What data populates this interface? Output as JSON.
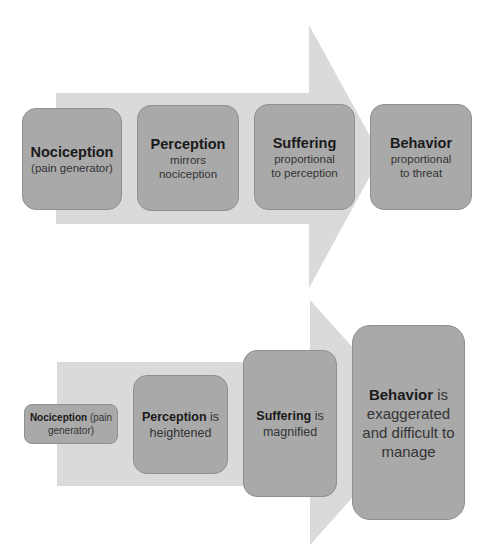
{
  "colors": {
    "arrow_fill": "#dadada",
    "box_fill": "#a9a9a9",
    "box_border": "#8f8f8f",
    "text": "#1a1a1a"
  },
  "top_arrow": {
    "description": "Normal pain pathway (proportional)",
    "steps": [
      {
        "title": "Nociception",
        "subtitle": "(pain generator)"
      },
      {
        "title": "Perception",
        "subtitle": "mirrors nociception",
        "subtitle_lines": [
          "mirrors",
          "nociception"
        ]
      },
      {
        "title": "Suffering",
        "subtitle": "proportional to perception",
        "subtitle_lines": [
          "proportional",
          "to perception"
        ]
      },
      {
        "title": "Behavior",
        "subtitle": "proportional to threat",
        "subtitle_lines": [
          "proportional",
          "to threat"
        ]
      }
    ]
  },
  "bottom_arrow": {
    "description": "Amplified pain pathway (escalating)",
    "steps": [
      {
        "bold": "Nociception",
        "rest": " (pain generator)"
      },
      {
        "bold": "Perception",
        "rest": " is heightened"
      },
      {
        "bold": "Suffering",
        "rest": " is magnified"
      },
      {
        "bold": "Behavior",
        "rest": " is exaggerated and difficult to manage"
      }
    ]
  }
}
